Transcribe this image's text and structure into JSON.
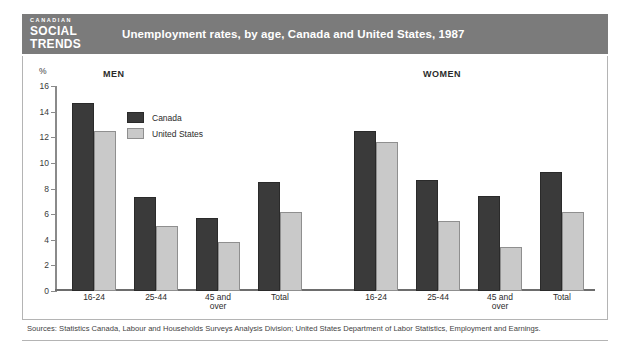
{
  "header": {
    "brand_line1": "CANADIAN",
    "brand_line2": "SOCIAL",
    "brand_line3": "TRENDS",
    "title": "Unemployment rates, by age, Canada and United States, 1987"
  },
  "axis": {
    "unit_label": "%",
    "ticks": [
      "0",
      "2",
      "4",
      "6",
      "8",
      "10",
      "12",
      "14",
      "16"
    ]
  },
  "legend": {
    "items": [
      {
        "label": "Canada",
        "color": "#3a3a3a"
      },
      {
        "label": "United States",
        "color": "#c9c9c9"
      }
    ]
  },
  "panels": [
    {
      "title": "MEN"
    },
    {
      "title": "WOMEN"
    }
  ],
  "categories": [
    "16-24",
    "25-44",
    "45 and\nover",
    "Total"
  ],
  "source": "Sources: Statistics Canada, Labour and Households Surveys Analysis Division; United States Department of Labor Statistics, Employment and Earnings.",
  "chart_data": {
    "type": "bar",
    "title": "Unemployment rates, by age, Canada and United States, 1987",
    "xlabel": "",
    "ylabel": "%",
    "ylim": [
      0,
      16
    ],
    "ytick_step": 2,
    "grid": false,
    "legend_position": "inside-top-left",
    "panels": [
      {
        "name": "MEN",
        "categories": [
          "16-24",
          "25-44",
          "45 and over",
          "Total"
        ],
        "series": [
          {
            "name": "Canada",
            "values": [
              14.7,
              7.3,
              5.7,
              8.5
            ]
          },
          {
            "name": "United States",
            "values": [
              12.5,
              5.1,
              3.85,
              6.15
            ]
          }
        ]
      },
      {
        "name": "WOMEN",
        "categories": [
          "16-24",
          "25-44",
          "45 and over",
          "Total"
        ],
        "series": [
          {
            "name": "Canada",
            "values": [
              12.5,
              8.7,
              7.4,
              9.3
            ]
          },
          {
            "name": "United States",
            "values": [
              11.6,
              5.5,
              3.45,
              6.15
            ]
          }
        ]
      }
    ]
  }
}
